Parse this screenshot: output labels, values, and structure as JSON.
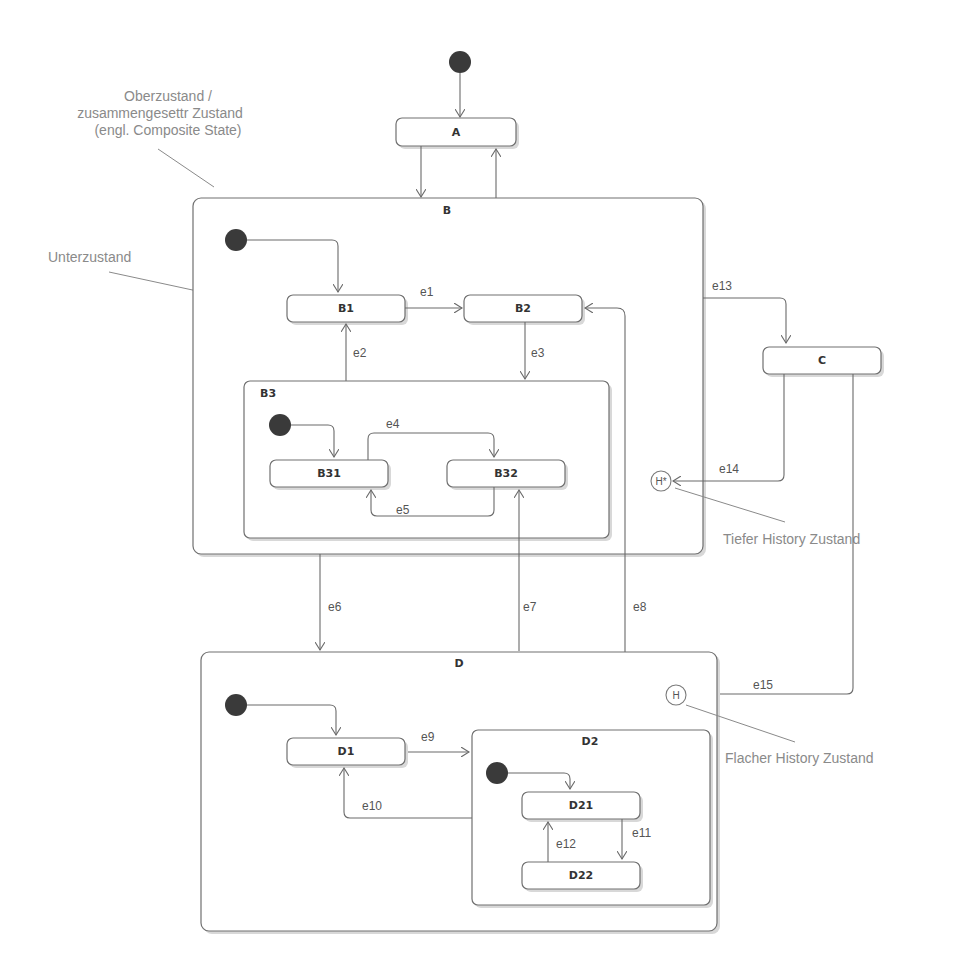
{
  "diagram": {
    "type": "UML state machine",
    "states": {
      "A": "A",
      "B": "B",
      "B1": "B1",
      "B2": "B2",
      "B3": "B3",
      "B31": "B31",
      "B32": "B32",
      "C": "C",
      "D": "D",
      "D1": "D1",
      "D2": "D2",
      "D21": "D21",
      "D22": "D22"
    },
    "history": {
      "deep": "H*",
      "shallow": "H"
    },
    "transitions": {
      "e1": "e1",
      "e2": "e2",
      "e3": "e3",
      "e4": "e4",
      "e5": "e5",
      "e6": "e6",
      "e7": "e7",
      "e8": "e8",
      "e9": "e9",
      "e10": "e10",
      "e11": "e11",
      "e12": "e12",
      "e13": "e13",
      "e14": "e14",
      "e15": "e15"
    },
    "annotations": {
      "composite_line1": "Oberzustand /",
      "composite_line2": "zusammengesettr Zustand",
      "composite_line3": "(engl. Composite State)",
      "substate": "Unterzustand",
      "deep_history": "Tiefer History Zustand",
      "shallow_history": "Flacher History Zustand"
    },
    "colors": {
      "line": "#6a6a6a",
      "initial_node": "#3a3a3a",
      "annotation_text": "#8a8a8a"
    }
  }
}
